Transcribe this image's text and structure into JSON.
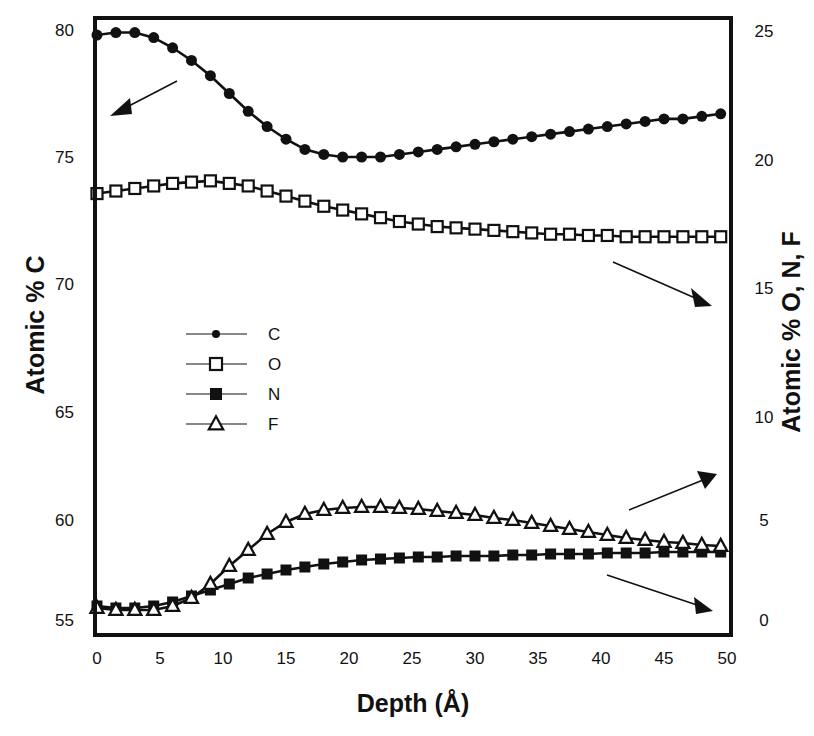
{
  "chart_data": {
    "type": "line",
    "title": "",
    "xlabel": "Depth (Å)",
    "ylabel": "Atomic % C",
    "ylabel_right": "Atomic % O, N, F",
    "xlim": [
      0,
      50
    ],
    "ylim": [
      55,
      80
    ],
    "ylim_right": [
      0,
      25
    ],
    "grid": false,
    "legend_position": "inside-left-middle",
    "x_ticks": [
      "0",
      "5",
      "10",
      "15",
      "20",
      "25",
      "30",
      "35",
      "40",
      "45",
      "50"
    ],
    "y_ticks_left": [
      "80",
      "75",
      "70",
      "65",
      "60",
      "55"
    ],
    "y_ticks_right": [
      "25",
      "20",
      "15",
      "10",
      "5",
      "0"
    ],
    "x": [
      0,
      1.5,
      3,
      4.5,
      6,
      7.5,
      9,
      10.5,
      12,
      13.5,
      15,
      16.5,
      18,
      19.5,
      21,
      22.5,
      24,
      25.5,
      27,
      28.5,
      30,
      31.5,
      33,
      34.5,
      36,
      37.5,
      39,
      40.5,
      42,
      43.5,
      45,
      46.5,
      48,
      49.5
    ],
    "series": [
      {
        "name": "C",
        "axis": "left",
        "marker": "filled-circle",
        "values": [
          79.8,
          79.9,
          79.9,
          79.7,
          79.3,
          78.8,
          78.2,
          77.5,
          76.8,
          76.2,
          75.7,
          75.3,
          75.1,
          75.0,
          75.0,
          75.0,
          75.1,
          75.2,
          75.3,
          75.4,
          75.5,
          75.6,
          75.7,
          75.8,
          75.9,
          76.0,
          76.1,
          76.2,
          76.3,
          76.4,
          76.5,
          76.5,
          76.6,
          76.7
        ]
      },
      {
        "name": "O",
        "axis": "right",
        "marker": "open-square",
        "values": [
          18.6,
          18.7,
          18.8,
          18.9,
          19.0,
          19.05,
          19.1,
          19.0,
          18.9,
          18.7,
          18.5,
          18.3,
          18.1,
          17.95,
          17.8,
          17.65,
          17.5,
          17.4,
          17.3,
          17.25,
          17.2,
          17.15,
          17.1,
          17.05,
          17.0,
          17.0,
          16.95,
          16.95,
          16.9,
          16.9,
          16.9,
          16.9,
          16.9,
          16.9
        ]
      },
      {
        "name": "N",
        "axis": "right",
        "marker": "filled-square",
        "values": [
          0.7,
          0.6,
          0.6,
          0.7,
          0.9,
          1.2,
          1.5,
          1.8,
          2.1,
          2.3,
          2.5,
          2.65,
          2.8,
          2.9,
          3.0,
          3.05,
          3.1,
          3.15,
          3.15,
          3.2,
          3.2,
          3.2,
          3.25,
          3.25,
          3.3,
          3.3,
          3.3,
          3.35,
          3.35,
          3.35,
          3.4,
          3.4,
          3.4,
          3.4
        ]
      },
      {
        "name": "F",
        "axis": "right",
        "marker": "open-triangle",
        "values": [
          0.6,
          0.5,
          0.5,
          0.5,
          0.7,
          1.1,
          1.8,
          2.7,
          3.5,
          4.3,
          4.9,
          5.3,
          5.5,
          5.6,
          5.65,
          5.65,
          5.6,
          5.55,
          5.45,
          5.35,
          5.25,
          5.1,
          5.0,
          4.85,
          4.7,
          4.55,
          4.4,
          4.25,
          4.1,
          4.0,
          3.9,
          3.85,
          3.75,
          3.7
        ]
      }
    ],
    "annotations": [
      {
        "type": "arrow",
        "label": "C → left axis",
        "direction": "down-left"
      },
      {
        "type": "arrow",
        "label": "O → right axis",
        "direction": "down-right"
      },
      {
        "type": "arrow",
        "label": "F → right axis",
        "direction": "up-right"
      },
      {
        "type": "arrow",
        "label": "N → right axis",
        "direction": "down-right"
      }
    ]
  },
  "labels": {
    "xlabel": "Depth (Å)",
    "ylabel_left": "Atomic % C",
    "ylabel_right": "Atomic % O, N, F"
  },
  "legend": [
    {
      "label": "C",
      "marker": "filled-circle"
    },
    {
      "label": "O",
      "marker": "open-square"
    },
    {
      "label": "N",
      "marker": "filled-square"
    },
    {
      "label": "F",
      "marker": "open-triangle"
    }
  ]
}
